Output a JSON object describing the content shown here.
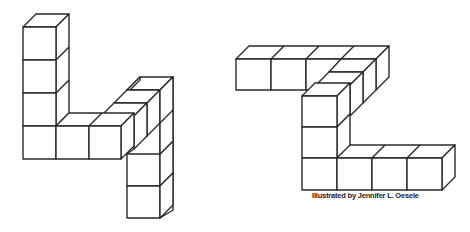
{
  "figures": [
    {
      "name": "cube-shape-left",
      "description": "Isometric cube structure resembling the digit 4",
      "cube_count": 13
    },
    {
      "name": "cube-shape-right",
      "description": "Isometric cube structure resembling the letter Z",
      "cube_count": 14
    }
  ],
  "caption": "Illustrated by Jennifer L. Oesele",
  "colors": {
    "stroke": "#2a2a2a",
    "fill": "#ffffff"
  }
}
